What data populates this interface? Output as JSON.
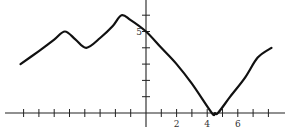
{
  "chart_data": {
    "type": "line",
    "title": "",
    "xlabel": "",
    "ylabel": "",
    "xlim": [
      -9,
      9
    ],
    "ylim": [
      -1,
      7
    ],
    "grid": false,
    "legend": "none",
    "x_ticks": [
      -8,
      -7,
      -6,
      -5,
      -4,
      -3,
      -2,
      -1,
      1,
      2,
      3,
      4,
      5,
      6,
      7,
      8
    ],
    "x_tick_labels": [
      {
        "value": 2,
        "label": "2"
      },
      {
        "value": 4,
        "label": "4"
      },
      {
        "value": 6,
        "label": "6"
      }
    ],
    "y_ticks": [
      1,
      2,
      3,
      4,
      5,
      6
    ],
    "y_tick_labels": [
      {
        "value": 5,
        "label": "5"
      }
    ],
    "series": [
      {
        "name": "f(x)",
        "x": [
          -8.2,
          -7,
          -6,
          -5.3,
          -4.6,
          -3.9,
          -3,
          -2.2,
          -1.6,
          -1,
          0,
          1,
          2,
          3,
          4.3,
          4.5,
          4.7,
          5.5,
          6.5,
          7.3,
          8.2
        ],
        "y": [
          3.0,
          3.8,
          4.5,
          5.0,
          4.5,
          4.0,
          4.6,
          5.3,
          6.0,
          5.7,
          5.0,
          4.0,
          3.0,
          1.8,
          0.0,
          0.0,
          0.0,
          1.0,
          2.2,
          3.4,
          4.0
        ]
      }
    ]
  }
}
